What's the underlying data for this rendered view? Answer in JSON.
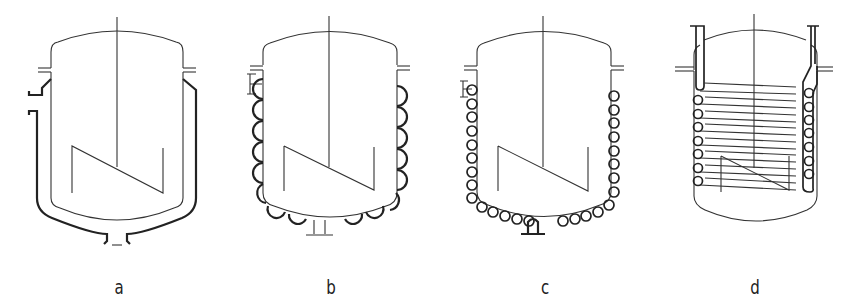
{
  "figure": {
    "panels": [
      {
        "id": "a",
        "label": "a",
        "feature": "jacket",
        "agitator": "anchor-blade",
        "nozzles": [
          "side-inlet",
          "bottom-outlet"
        ]
      },
      {
        "id": "b",
        "label": "b",
        "feature": "half-pipe-coil",
        "agitator": "anchor-blade",
        "coil_turns_side": 6,
        "coil_turns_bottom": 4
      },
      {
        "id": "c",
        "label": "c",
        "feature": "welded-tube-coil",
        "agitator": "anchor-blade",
        "coil_turns_side": 9,
        "coil_turns_bottom": 9
      },
      {
        "id": "d",
        "label": "d",
        "feature": "internal-coil",
        "agitator": "anchor-blade",
        "coil_turns": 8
      }
    ]
  },
  "colors": {
    "background": "#ffffff",
    "line": "#222222"
  }
}
